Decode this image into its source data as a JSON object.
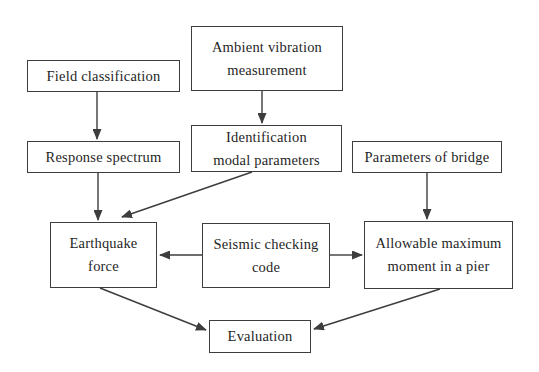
{
  "diagram": {
    "type": "flowchart",
    "colors": {
      "background": "#ffffff",
      "box_border": "#3d3d3d",
      "arrow": "#3d3d3d",
      "text": "#1f1f1f"
    },
    "boxes": {
      "field_classification": {
        "label": "Field classification"
      },
      "ambient_vibration": {
        "line1": "Ambient vibration",
        "line2": "measurement"
      },
      "response_spectrum": {
        "label": "Response spectrum"
      },
      "identification": {
        "line1": "Identification",
        "line2": "modal parameters"
      },
      "parameters_of_bridge": {
        "label": "Parameters of bridge"
      },
      "earthquake_force": {
        "line1": "Earthquake",
        "line2": "force"
      },
      "seismic_checking_code": {
        "line1": "Seismic checking",
        "line2": "code"
      },
      "allowable_maximum": {
        "line1": "Allowable maximum",
        "line2": "moment in a pier"
      },
      "evaluation": {
        "label": "Evaluation"
      }
    },
    "arrows": [
      {
        "from": "field_classification",
        "to": "response_spectrum"
      },
      {
        "from": "ambient_vibration",
        "to": "identification"
      },
      {
        "from": "response_spectrum",
        "to": "earthquake_force"
      },
      {
        "from": "identification",
        "to": "earthquake_force"
      },
      {
        "from": "parameters_of_bridge",
        "to": "allowable_maximum"
      },
      {
        "from": "seismic_checking_code",
        "to": "earthquake_force"
      },
      {
        "from": "seismic_checking_code",
        "to": "allowable_maximum"
      },
      {
        "from": "earthquake_force",
        "to": "evaluation"
      },
      {
        "from": "allowable_maximum",
        "to": "evaluation"
      }
    ]
  }
}
